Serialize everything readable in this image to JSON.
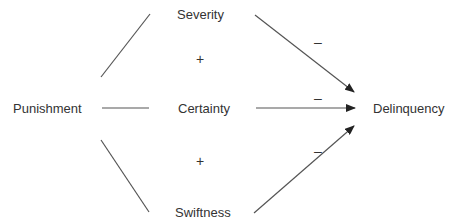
{
  "diagram": {
    "nodes": {
      "punishment": "Punishment",
      "severity": "Severity",
      "certainty": "Certainty",
      "swiftness": "Swiftness",
      "delinquency": "Delinquency"
    },
    "signs": {
      "between_severity_certainty": "+",
      "between_certainty_swiftness": "+",
      "severity_to_delinquency": "–",
      "certainty_to_delinquency": "–",
      "swiftness_to_delinquency": "–"
    },
    "edges": [
      {
        "from": "Punishment",
        "to": "Severity",
        "type": "line"
      },
      {
        "from": "Punishment",
        "to": "Certainty",
        "type": "line"
      },
      {
        "from": "Punishment",
        "to": "Swiftness",
        "type": "line"
      },
      {
        "from": "Severity",
        "to": "Delinquency",
        "type": "arrow",
        "sign": "–"
      },
      {
        "from": "Certainty",
        "to": "Delinquency",
        "type": "arrow",
        "sign": "–"
      },
      {
        "from": "Swiftness",
        "to": "Delinquency",
        "type": "arrow",
        "sign": "–"
      }
    ],
    "line_color": "#444444"
  }
}
